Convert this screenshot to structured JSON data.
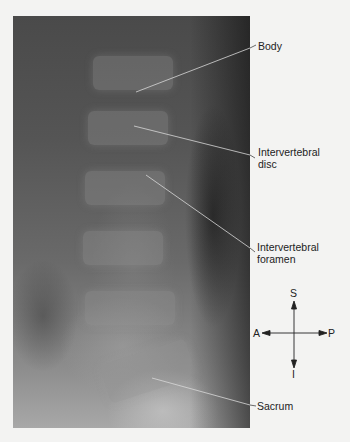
{
  "figure": {
    "type": "lateral lumbar spine radiograph",
    "labels": [
      {
        "id": "body",
        "text": "Body"
      },
      {
        "id": "disc",
        "line1": "Intervertebral",
        "line2": "disc"
      },
      {
        "id": "foramen",
        "line1": "Intervertebral",
        "line2": "foramen"
      },
      {
        "id": "sacrum",
        "text": "Sacrum"
      }
    ],
    "compass": {
      "superior": "S",
      "inferior": "I",
      "anterior": "A",
      "posterior": "P"
    }
  }
}
